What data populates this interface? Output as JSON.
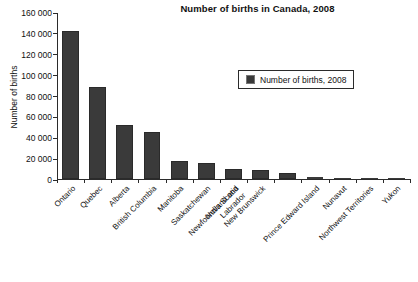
{
  "chart_data": {
    "type": "bar",
    "title": "Number of births in Canada, 2008",
    "xlabel": "",
    "ylabel": "Number of births",
    "ylim": [
      0,
      160000
    ],
    "ytick_step": 20000,
    "grid": false,
    "legend_position": "inside-top-right",
    "series": [
      {
        "name": "Number of births, 2008",
        "color": "#3a3a3a",
        "values": [
          142000,
          88000,
          52000,
          45000,
          17000,
          15000,
          10000,
          8500,
          6000,
          1500,
          800,
          700,
          400
        ]
      }
    ],
    "categories": [
      "Ontario",
      "Quebec",
      "Alberta",
      "British Columbia",
      "Manitoba",
      "Saskatchewan",
      "Nova Scotia",
      "New Brunswick",
      "Newfoundland and Labrador",
      "Prince Edward Island",
      "Nunavut",
      "Northwest Territories",
      "Yukon"
    ],
    "ytick_labels": [
      "0",
      "20 000",
      "40 000",
      "60 000",
      "80 000",
      "100 000",
      "120 000",
      "140 000",
      "160 000"
    ],
    "legend": [
      {
        "label": "Number of births, 2008",
        "color": "#3a3a3a"
      }
    ]
  }
}
